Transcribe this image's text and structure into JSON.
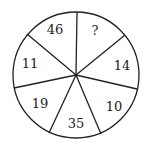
{
  "puzzle": {
    "segments": [
      {
        "label": "?",
        "x": 95,
        "y": 34
      },
      {
        "label": "14",
        "x": 121,
        "y": 70
      },
      {
        "label": "10",
        "x": 113,
        "y": 110
      },
      {
        "label": "35",
        "x": 76,
        "y": 129
      },
      {
        "label": "19",
        "x": 40,
        "y": 108
      },
      {
        "label": "11",
        "x": 30,
        "y": 66
      },
      {
        "label": "46",
        "x": 55,
        "y": 34
      }
    ]
  }
}
